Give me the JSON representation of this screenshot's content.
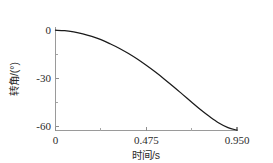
{
  "chart_data": {
    "type": "line",
    "title": "",
    "xlabel": "时间/s",
    "ylabel": "转角/(°)",
    "xlim": [
      0,
      0.95
    ],
    "ylim": [
      -62.5,
      2.0
    ],
    "grid": false,
    "legend": null,
    "x_ticks": [
      "0",
      "0.475",
      "0.950"
    ],
    "x_tick_values": [
      0,
      0.475,
      0.95
    ],
    "y_ticks": [
      "0",
      "-30",
      "-60"
    ],
    "y_tick_values": [
      0,
      -30,
      -60
    ],
    "x_minor_tick_values": [
      0.2375,
      0.7125
    ],
    "y_minor_tick_values": [
      -15,
      -45
    ],
    "series": [
      {
        "name": "转角",
        "color": "#1a1a1a",
        "x": [
          0.0,
          0.048,
          0.095,
          0.143,
          0.19,
          0.238,
          0.285,
          0.333,
          0.38,
          0.428,
          0.475,
          0.523,
          0.57,
          0.618,
          0.665,
          0.713,
          0.76,
          0.808,
          0.855,
          0.903,
          0.95
        ],
        "y": [
          0.0,
          -0.3,
          -1.1,
          -2.3,
          -3.9,
          -5.9,
          -8.4,
          -11.2,
          -14.4,
          -18.0,
          -21.9,
          -26.1,
          -30.5,
          -35.2,
          -40.0,
          -44.9,
          -49.6,
          -54.0,
          -57.8,
          -60.7,
          -62.3
        ]
      }
    ]
  },
  "axis_labels": {
    "x_title": "时间/s",
    "y_title": "转角/(°)"
  },
  "colors": {
    "curve": "#1a1a1a",
    "axis": "#9a9a9a",
    "text": "#2b2b2b",
    "background": "#ffffff"
  }
}
